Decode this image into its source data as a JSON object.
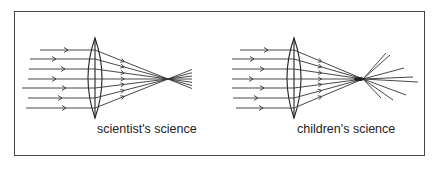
{
  "diagram": {
    "panels": [
      {
        "id": "scientists",
        "caption": "scientist's science",
        "lens_x": 95,
        "lens_top": 38,
        "lens_bottom": 118,
        "focus": [
          168,
          79
        ],
        "description": "parallel rays converge to a single sharp focal point"
      },
      {
        "id": "childrens",
        "caption": "children's science",
        "lens_x": 294,
        "lens_top": 38,
        "lens_bottom": 118,
        "focus": [
          363,
          79
        ],
        "description": "parallel rays converge roughly, then scatter in many directions"
      }
    ],
    "ray_y": [
      50,
      59,
      69,
      79,
      88,
      98,
      108
    ]
  }
}
